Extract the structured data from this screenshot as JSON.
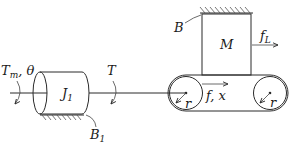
{
  "diagram": {
    "labels": {
      "motor_torque": "T",
      "motor_torque_sub": "m",
      "motor_angle": ", θ",
      "inertia": "J",
      "inertia_sub": "1",
      "inertia_damping": "B",
      "inertia_damping_sub": "1",
      "shaft_torque": "T",
      "pulley_left_radius": "r",
      "pulley_right_radius": "r",
      "mass": "M",
      "mass_damping": "B",
      "load_force": "f",
      "load_force_sub": "L",
      "belt_force": "f, x"
    },
    "components": [
      {
        "id": "motor-input",
        "type": "torque-input",
        "label": "Tm, θ"
      },
      {
        "id": "inertia-J1",
        "type": "cylinder",
        "label": "J1"
      },
      {
        "id": "damper-B1",
        "type": "ground-friction",
        "label": "B1"
      },
      {
        "id": "shaft",
        "type": "shaft",
        "label": "T"
      },
      {
        "id": "pulley-left",
        "type": "pulley",
        "label": "r"
      },
      {
        "id": "pulley-right",
        "type": "pulley",
        "label": "r"
      },
      {
        "id": "belt",
        "type": "belt",
        "label": "f, x"
      },
      {
        "id": "mass-M",
        "type": "block",
        "label": "M"
      },
      {
        "id": "damper-B",
        "type": "ground-friction",
        "label": "B"
      },
      {
        "id": "load-force",
        "type": "force-arrow",
        "label": "fL"
      }
    ],
    "colors": {
      "stroke": "#2a2a2a",
      "background": "#ffffff"
    }
  }
}
